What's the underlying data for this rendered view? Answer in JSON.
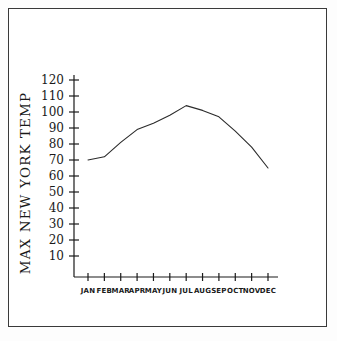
{
  "chart_data": {
    "type": "line",
    "title": "",
    "xlabel": "",
    "ylabel": "MAX NEW YORK TEMP",
    "categories": [
      "JAN",
      "FEB",
      "MAR",
      "APR",
      "MAY",
      "JUN",
      "JUL",
      "AUG",
      "SEP",
      "OCT",
      "NOV",
      "DEC"
    ],
    "values": [
      70,
      72,
      81,
      89,
      93,
      98,
      104,
      101,
      97,
      88,
      78,
      65
    ],
    "ylim": [
      0,
      125
    ],
    "yticks": [
      10,
      20,
      30,
      40,
      50,
      60,
      70,
      80,
      90,
      100,
      110,
      120
    ],
    "ytick_labels": [
      "10",
      "20",
      "30",
      "40",
      "50",
      "60",
      "70",
      "80",
      "90",
      "100",
      "110",
      "120"
    ],
    "grid": false,
    "legend": false,
    "line_color": "#2b2b2b",
    "axis_color": "#1a1a1a",
    "background_color": "#ffffff",
    "border_color": "#3a3a3a"
  }
}
